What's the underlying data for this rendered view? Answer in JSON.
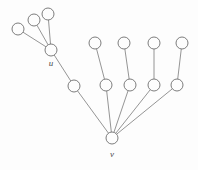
{
  "figure": {
    "width": 198,
    "height": 170,
    "background_color": "#fdfdfd",
    "node_fill_color": "#fdfdfd",
    "node_stroke_color": "#6e6e6e",
    "edge_color": "#7a7a7a",
    "label_color": "#4a4a4a"
  },
  "graph": {
    "node_radius": 6,
    "nodes": [
      {
        "id": "u_leaf_1",
        "label": "",
        "cx": 18,
        "cy": 29,
        "r": 6
      },
      {
        "id": "u_leaf_2",
        "label": "",
        "cx": 34,
        "cy": 20,
        "r": 6
      },
      {
        "id": "u_leaf_3",
        "label": "",
        "cx": 48,
        "cy": 14,
        "r": 6
      },
      {
        "id": "u",
        "label": "u",
        "cx": 51,
        "cy": 50,
        "r": 6,
        "label_x": 51,
        "label_y": 64
      },
      {
        "id": "mid_1",
        "label": "",
        "cx": 74,
        "cy": 86,
        "r": 6
      },
      {
        "id": "mid_2",
        "label": "",
        "cx": 106,
        "cy": 85,
        "r": 6
      },
      {
        "id": "mid_3",
        "label": "",
        "cx": 130,
        "cy": 85,
        "r": 6
      },
      {
        "id": "mid_4",
        "label": "",
        "cx": 154,
        "cy": 85,
        "r": 6
      },
      {
        "id": "mid_5",
        "label": "",
        "cx": 177,
        "cy": 85,
        "r": 6
      },
      {
        "id": "top_1",
        "label": "",
        "cx": 95,
        "cy": 43,
        "r": 6
      },
      {
        "id": "top_2",
        "label": "",
        "cx": 124,
        "cy": 43,
        "r": 6
      },
      {
        "id": "top_3",
        "label": "",
        "cx": 154,
        "cy": 43,
        "r": 6
      },
      {
        "id": "top_4",
        "label": "",
        "cx": 182,
        "cy": 43,
        "r": 6
      },
      {
        "id": "v",
        "label": "v",
        "cx": 112,
        "cy": 138,
        "r": 6,
        "label_x": 112,
        "label_y": 155
      }
    ],
    "edges": [
      {
        "from": "u_leaf_1",
        "to": "u"
      },
      {
        "from": "u_leaf_2",
        "to": "u"
      },
      {
        "from": "u_leaf_3",
        "to": "u"
      },
      {
        "from": "u",
        "to": "mid_1"
      },
      {
        "from": "mid_1",
        "to": "v"
      },
      {
        "from": "mid_2",
        "to": "v"
      },
      {
        "from": "mid_3",
        "to": "v"
      },
      {
        "from": "mid_4",
        "to": "v"
      },
      {
        "from": "mid_5",
        "to": "v"
      },
      {
        "from": "top_1",
        "to": "mid_2"
      },
      {
        "from": "top_2",
        "to": "mid_3"
      },
      {
        "from": "top_3",
        "to": "mid_4"
      },
      {
        "from": "top_4",
        "to": "mid_5"
      }
    ],
    "labels": [
      {
        "id": "label-u",
        "text": "u"
      },
      {
        "id": "label-v",
        "text": "v"
      }
    ]
  }
}
